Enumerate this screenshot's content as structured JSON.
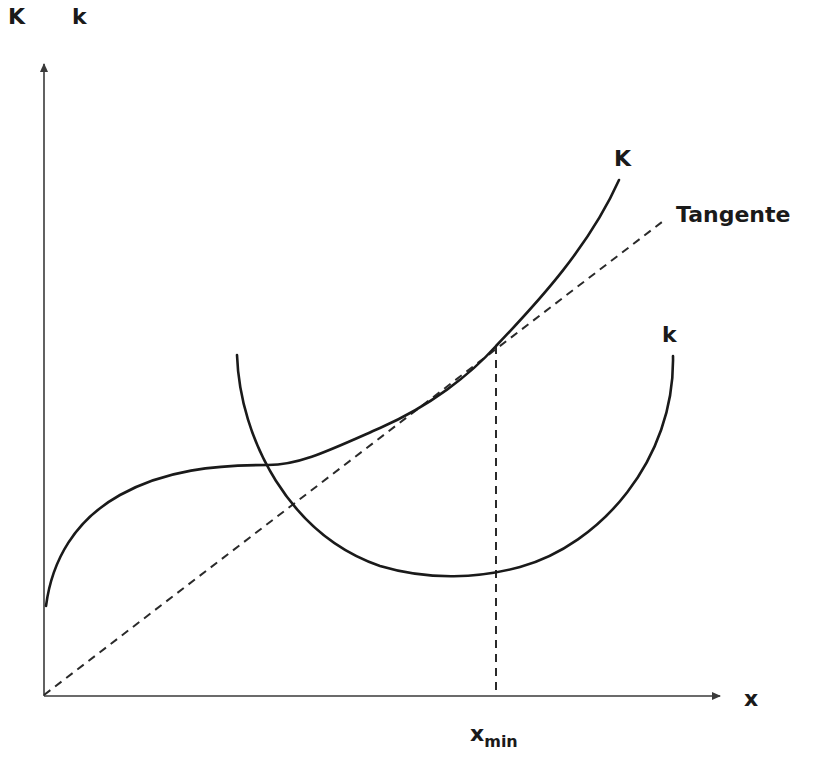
{
  "diagram": {
    "type": "cost-curve diagram",
    "axes": {
      "y_labels": [
        "K",
        "k"
      ],
      "x_label": "x"
    },
    "curves": [
      {
        "id": "total-cost",
        "label": "K",
        "style": "solid"
      },
      {
        "id": "average-cost",
        "label": "k",
        "style": "solid"
      },
      {
        "id": "tangent",
        "label": "Tangente",
        "style": "dashed"
      }
    ],
    "markers": {
      "x_min_base": "x",
      "x_min_sub": "min"
    }
  },
  "colors": {
    "line": "#1a1a1a",
    "axis": "#3a3a3a",
    "background": "#ffffff"
  }
}
